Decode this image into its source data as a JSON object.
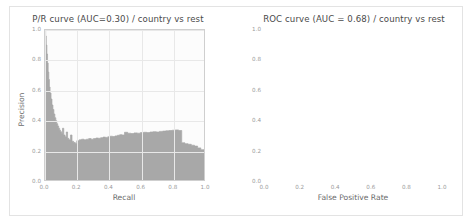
{
  "figure": {
    "background_color": "#ffffff",
    "border_color": "#e3e3e3",
    "fill_color": "#a8a8a8",
    "axes_background": "#fcfcfc",
    "grid_color": "#e8e8e8",
    "diagonal_color": "#2b2b2b"
  },
  "chart_data": [
    {
      "type": "area",
      "title": "P/R curve (AUC=0.30) / country vs rest",
      "xlabel": "Recall",
      "ylabel": "Precision",
      "xlim": [
        0.0,
        1.0
      ],
      "ylim": [
        0.0,
        1.0
      ],
      "xticks": [
        "0.0",
        "0.2",
        "0.4",
        "0.6",
        "0.8",
        "1.0"
      ],
      "yticks": [
        "0.0",
        "0.2",
        "0.4",
        "0.6",
        "0.8",
        "1.0"
      ],
      "xtick_values": [
        0.0,
        0.2,
        0.4,
        0.6,
        0.8,
        1.0
      ],
      "ytick_values": [
        0.0,
        0.2,
        0.4,
        0.6,
        0.8,
        1.0
      ],
      "grid": true,
      "legend": "none",
      "auc": 0.3,
      "series": [
        {
          "name": "precision-recall",
          "drawstyle": "steps-post",
          "x": [
            0.0,
            0.004,
            0.008,
            0.012,
            0.016,
            0.02,
            0.024,
            0.028,
            0.032,
            0.038,
            0.044,
            0.05,
            0.056,
            0.062,
            0.068,
            0.074,
            0.08,
            0.086,
            0.092,
            0.098,
            0.104,
            0.11,
            0.118,
            0.126,
            0.134,
            0.142,
            0.15,
            0.16,
            0.17,
            0.18,
            0.19,
            0.2,
            0.215,
            0.23,
            0.245,
            0.26,
            0.275,
            0.29,
            0.305,
            0.32,
            0.335,
            0.35,
            0.365,
            0.38,
            0.395,
            0.41,
            0.425,
            0.44,
            0.455,
            0.47,
            0.485,
            0.5,
            0.52,
            0.54,
            0.56,
            0.58,
            0.6,
            0.62,
            0.64,
            0.66,
            0.68,
            0.7,
            0.72,
            0.74,
            0.76,
            0.78,
            0.8,
            0.82,
            0.84,
            0.86,
            0.88,
            0.9,
            0.92,
            0.94,
            0.96,
            0.98,
            1.0
          ],
          "y": [
            1.0,
            0.96,
            0.9,
            0.84,
            0.78,
            0.72,
            0.67,
            0.62,
            0.58,
            0.54,
            0.5,
            0.47,
            0.44,
            0.415,
            0.395,
            0.375,
            0.36,
            0.345,
            0.332,
            0.322,
            0.312,
            0.345,
            0.3,
            0.288,
            0.32,
            0.278,
            0.268,
            0.3,
            0.258,
            0.25,
            0.245,
            0.262,
            0.268,
            0.272,
            0.268,
            0.272,
            0.276,
            0.272,
            0.276,
            0.28,
            0.278,
            0.282,
            0.286,
            0.284,
            0.288,
            0.292,
            0.29,
            0.294,
            0.298,
            0.302,
            0.3,
            0.318,
            0.312,
            0.31,
            0.314,
            0.312,
            0.316,
            0.318,
            0.316,
            0.32,
            0.322,
            0.32,
            0.324,
            0.326,
            0.328,
            0.33,
            0.332,
            0.334,
            0.33,
            0.248,
            0.242,
            0.238,
            0.232,
            0.226,
            0.214,
            0.202,
            0.186
          ]
        }
      ]
    },
    {
      "type": "area",
      "title": "ROC curve (AUC = 0.68) / country vs rest",
      "xlabel": "False Positive Rate",
      "ylabel": "True Positive Rate",
      "xlim": [
        0.0,
        1.0
      ],
      "ylim": [
        0.0,
        1.0
      ],
      "xticks": [
        "0.0",
        "0.2",
        "0.4",
        "0.6",
        "0.8",
        "1.0"
      ],
      "yticks": [
        "0.0",
        "0.2",
        "0.4",
        "0.6",
        "0.8",
        "1.0"
      ],
      "xtick_values": [
        0.0,
        0.2,
        0.4,
        0.6,
        0.8,
        1.0
      ],
      "ytick_values": [
        0.0,
        0.2,
        0.4,
        0.6,
        0.8,
        1.0
      ],
      "grid": true,
      "legend": "none",
      "auc": 0.68,
      "series": [
        {
          "name": "roc",
          "drawstyle": "steps-post",
          "x": [
            0.0,
            0.005,
            0.005,
            0.012,
            0.012,
            0.02,
            0.02,
            0.03,
            0.03,
            0.042,
            0.042,
            0.055,
            0.055,
            0.07,
            0.07,
            0.085,
            0.085,
            0.1,
            0.1,
            0.118,
            0.118,
            0.135,
            0.135,
            0.152,
            0.152,
            0.17,
            0.17,
            0.19,
            0.19,
            0.215,
            0.215,
            0.24,
            0.24,
            0.265,
            0.265,
            0.3,
            0.3,
            0.34,
            0.34,
            0.38,
            0.38,
            0.43,
            0.43,
            0.48,
            0.48,
            0.53,
            0.53,
            0.58,
            0.58,
            0.62,
            0.62,
            0.66,
            0.66,
            0.7,
            0.7,
            0.745,
            0.745,
            0.79,
            0.79,
            0.84,
            0.84,
            0.89,
            0.89,
            0.94,
            0.94,
            1.0
          ],
          "y": [
            0.0,
            0.0,
            0.055,
            0.055,
            0.09,
            0.09,
            0.125,
            0.125,
            0.17,
            0.17,
            0.205,
            0.205,
            0.24,
            0.24,
            0.275,
            0.275,
            0.31,
            0.31,
            0.345,
            0.345,
            0.395,
            0.395,
            0.44,
            0.44,
            0.475,
            0.475,
            0.51,
            0.51,
            0.545,
            0.545,
            0.58,
            0.58,
            0.625,
            0.625,
            0.7,
            0.7,
            0.72,
            0.72,
            0.722,
            0.722,
            0.726,
            0.726,
            0.73,
            0.73,
            0.8,
            0.8,
            0.808,
            0.808,
            0.845,
            0.845,
            0.852,
            0.852,
            0.885,
            0.885,
            0.892,
            0.892,
            0.93,
            0.93,
            0.938,
            0.938,
            0.96,
            0.96,
            0.975,
            0.975,
            1.0,
            1.0
          ]
        },
        {
          "name": "chance-baseline",
          "style": "dashed",
          "x": [
            0.0,
            1.0
          ],
          "y": [
            0.0,
            1.0
          ]
        }
      ]
    }
  ]
}
